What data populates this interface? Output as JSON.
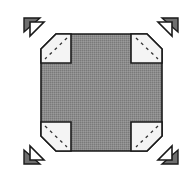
{
  "diagram": {
    "title": "",
    "colors": {
      "background": "#ffffff",
      "block_fill": "#8c8c8c",
      "corner_fill": "#f4f4f4",
      "outline": "#1a1a1a",
      "arrow_dark": "#6e6e6e",
      "arrow_light": "#ffffff"
    },
    "block": {
      "x": 41,
      "y": 34,
      "width": 121,
      "height": 117,
      "chamfer": 15
    },
    "corner_squares": [
      {
        "id": "top-left",
        "x": 41,
        "y": 34,
        "width": 30,
        "height": 29
      },
      {
        "id": "top-right",
        "x": 131,
        "y": 34,
        "width": 31,
        "height": 29
      },
      {
        "id": "bottom-left",
        "x": 41,
        "y": 122,
        "width": 30,
        "height": 29
      },
      {
        "id": "bottom-right",
        "x": 131,
        "y": 122,
        "width": 31,
        "height": 29
      }
    ],
    "arrows": [
      {
        "id": "top-left",
        "direction": "up-left"
      },
      {
        "id": "top-right",
        "direction": "up-right"
      },
      {
        "id": "bottom-left",
        "direction": "down-left"
      },
      {
        "id": "bottom-right",
        "direction": "down-right"
      }
    ]
  }
}
